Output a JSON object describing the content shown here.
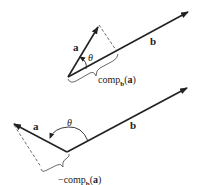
{
  "diagram": {
    "top": {
      "vector_a_label": "a",
      "vector_b_label": "b",
      "angle_label": "θ",
      "component_label_prefix": "comp",
      "component_label_sub": "b",
      "component_label_arg_open": "(",
      "component_label_arg": "a",
      "component_label_arg_close": ")"
    },
    "bottom": {
      "vector_a_label": "a",
      "vector_b_label": "b",
      "angle_label": "θ",
      "component_label_prefix": "−comp",
      "component_label_sub": "b",
      "component_label_arg_open": "(",
      "component_label_arg": "a",
      "component_label_arg_close": ")"
    },
    "colors": {
      "stroke": "#222222",
      "background": "#ffffff"
    }
  }
}
